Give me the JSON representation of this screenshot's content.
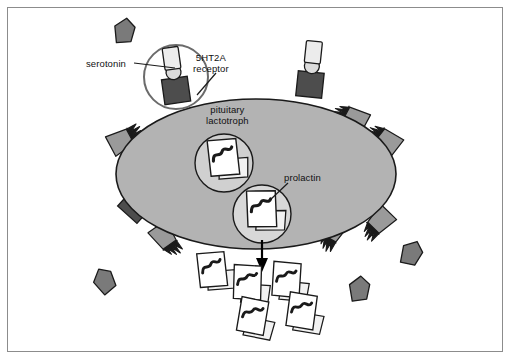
{
  "figure": {
    "width": 512,
    "height": 361,
    "background": "#ffffff",
    "frame_color": "#8c8c8c"
  },
  "labels": {
    "serotonin": "serotonin",
    "receptor_line1": "5HT2A",
    "receptor_line2": "receptor",
    "cell_line1": "pituitary",
    "cell_line2": "lactotroph",
    "prolactin": "prolactin"
  },
  "colors": {
    "cell_fill": "#b3b3b3",
    "cell_stroke": "#1a1a1a",
    "receptor_dark": "#4d4d4d",
    "ligand_light": "#e6e6e6",
    "circle_light": "#dcdcdc",
    "serotonin_gray": "#7a7a7a",
    "jagged_gray": "#9a9a9a",
    "vesicle_fill": "#d0d0d0",
    "granule_white": "#ffffff",
    "squiggle": "#1a1a1a",
    "arrow": "#000000",
    "leader_line": "#1a1a1a",
    "text": "#111111"
  },
  "cell": {
    "name": "pituitary lactotroph",
    "center_x": 256,
    "center_y": 174,
    "radius_x": 140,
    "radius_y": 75
  },
  "receptors": [
    {
      "id": "receptor-top-left",
      "x": 176,
      "y": 88,
      "rotation": -8,
      "bound": true,
      "highlighted": true
    },
    {
      "id": "receptor-top-right",
      "x": 310,
      "y": 84,
      "rotation": 6,
      "bound": true,
      "highlighted": false
    },
    {
      "id": "receptor-left",
      "x": 136,
      "y": 205,
      "rotation": 42,
      "bound": true,
      "highlighted": false
    }
  ],
  "highlight_circle": {
    "cx": 176,
    "cy": 77,
    "r": 32
  },
  "serotonin_free": [
    {
      "id": "serotonin-free-1",
      "x": 124,
      "y": 31,
      "rotation": 12
    },
    {
      "id": "serotonin-free-2",
      "x": 104,
      "y": 281,
      "rotation": -24
    },
    {
      "id": "serotonin-free-3",
      "x": 411,
      "y": 253,
      "rotation": 28
    },
    {
      "id": "serotonin-free-4",
      "x": 359,
      "y": 289,
      "rotation": 8
    }
  ],
  "jagged_shapes": [
    {
      "id": "jagged-left-upper",
      "x": 123,
      "y": 140,
      "rotation": -118
    },
    {
      "id": "jagged-left-lower",
      "x": 165,
      "y": 238,
      "rotation": -35
    },
    {
      "id": "jagged-right-upper",
      "x": 353,
      "y": 118,
      "rotation": 115
    },
    {
      "id": "jagged-right-mid",
      "x": 333,
      "y": 231,
      "rotation": 30
    },
    {
      "id": "jagged-right-lower",
      "x": 379,
      "y": 222,
      "rotation": 44
    },
    {
      "id": "jagged-far-right",
      "x": 386,
      "y": 140,
      "rotation": 125
    }
  ],
  "vesicles": [
    {
      "id": "vesicle-internal",
      "cx": 224,
      "cy": 163,
      "r": 29
    },
    {
      "id": "vesicle-secretory",
      "cx": 262,
      "cy": 214,
      "r": 29
    }
  ],
  "released_prolactin": [
    {
      "id": "prolactin-released-1",
      "x": 213,
      "y": 276,
      "rotation": -14
    },
    {
      "id": "prolactin-released-2",
      "x": 247,
      "y": 288,
      "rotation": -6
    },
    {
      "id": "prolactin-released-3",
      "x": 285,
      "y": 285,
      "rotation": -4
    },
    {
      "id": "prolactin-released-4",
      "x": 252,
      "y": 321,
      "rotation": 2
    },
    {
      "id": "prolactin-released-5",
      "x": 300,
      "y": 316,
      "rotation": 0
    }
  ],
  "arrow": {
    "x1": 262,
    "y1": 238,
    "x2": 262,
    "y2": 268
  },
  "leaders": [
    {
      "id": "leader-serotonin",
      "x1": 132,
      "y1": 63,
      "x2": 172,
      "y2": 67
    },
    {
      "id": "leader-receptor",
      "x1": 215,
      "y1": 72,
      "x2": 196,
      "y2": 94
    },
    {
      "id": "leader-prolactin",
      "x1": 288,
      "y1": 182,
      "x2": 268,
      "y2": 200
    }
  ]
}
